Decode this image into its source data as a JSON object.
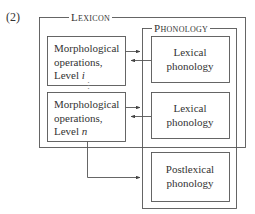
{
  "example_number": "(2)",
  "lexicon": {
    "title": "Lexicon",
    "morph_boxes": [
      {
        "line1": "Morphological",
        "line2": "operations,",
        "line3_prefix": "Level ",
        "level_var": "i"
      },
      {
        "line1": "Morphological",
        "line2": "operations,",
        "line3_prefix": "Level ",
        "level_var": "n"
      }
    ],
    "ellipsis": "⋮"
  },
  "phonology": {
    "title": "Phonology",
    "lexical_boxes": [
      {
        "line1": "Lexical",
        "line2": "phonology"
      },
      {
        "line1": "Lexical",
        "line2": "phonology"
      }
    ]
  },
  "postlexical": {
    "line1": "Postlexical",
    "line2": "phonology"
  },
  "colors": {
    "line": "#555555",
    "text": "#333333",
    "background": "#ffffff"
  }
}
